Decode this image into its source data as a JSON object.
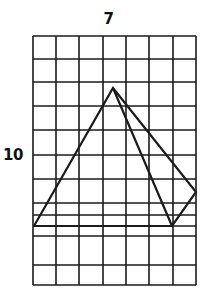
{
  "figure": {
    "type": "grid-with-polyline-figure",
    "background_color": "#ffffff",
    "ink_color": "#1a1a1a",
    "labels": {
      "top": "7",
      "left": "10"
    },
    "grid": {
      "columns": 7,
      "rows": 11,
      "x_left": 33,
      "x_right": 196,
      "y_top": 36,
      "y_bottom": 285,
      "line_color": "#1a1a1a",
      "line_width": 1.6,
      "vertical_line_x": [
        33,
        56,
        79,
        103,
        126,
        149,
        173,
        196
      ],
      "horizontal_line_y": [
        36,
        59,
        82,
        106,
        130,
        155,
        179,
        203,
        215,
        226,
        236,
        265,
        285
      ]
    },
    "shape": {
      "stroke_color": "#1a1a1a",
      "stroke_width": 2.2,
      "fill": "none",
      "paths": [
        {
          "name": "outer-polygon",
          "points": [
            [
              34,
              226
            ],
            [
              113,
              88
            ],
            [
              196,
              192
            ],
            [
              172,
              226
            ],
            [
              34,
              226
            ]
          ]
        },
        {
          "name": "inner-chord",
          "points": [
            [
              113,
              88
            ],
            [
              172,
              226
            ]
          ]
        }
      ]
    }
  }
}
